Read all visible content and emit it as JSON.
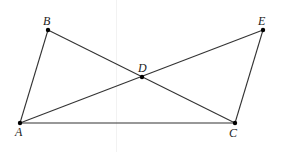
{
  "diagram": {
    "points": [
      {
        "id": "A",
        "label": "A"
      },
      {
        "id": "B",
        "label": "B"
      },
      {
        "id": "C",
        "label": "C"
      },
      {
        "id": "D",
        "label": "D"
      },
      {
        "id": "E",
        "label": "E"
      }
    ],
    "segments": [
      [
        "A",
        "B"
      ],
      [
        "B",
        "C"
      ],
      [
        "A",
        "E"
      ],
      [
        "E",
        "C"
      ],
      [
        "A",
        "C"
      ]
    ],
    "colors": {
      "line": "#333333",
      "point": "#000000",
      "label": "#222222"
    }
  }
}
